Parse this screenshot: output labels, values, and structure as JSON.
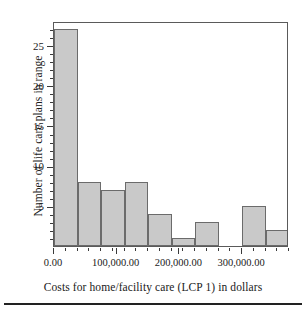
{
  "chart_data": {
    "type": "bar",
    "title": "",
    "xlabel": "Costs for home/facility care (LCP 1) in dollars",
    "ylabel": "Number of life care plans in range",
    "xlim": [
      0,
      375000
    ],
    "ylim": [
      0,
      28
    ],
    "grid": false,
    "legend": null,
    "bin_width": 37500,
    "bin_starts": [
      0,
      37500,
      75000,
      112500,
      150000,
      187500,
      225000,
      262500,
      300000,
      337500
    ],
    "categories": [
      "0–37,500",
      "37,500–75,000",
      "75,000–112,500",
      "112,500–150,000",
      "150,000–187,500",
      "187,500–225,000",
      "225,000–262,500",
      "262,500–300,000",
      "300,000–337,500",
      "337,500–375,000"
    ],
    "values": [
      27,
      8,
      7,
      8,
      4,
      1,
      3,
      0,
      5,
      2
    ],
    "xticks": [
      0,
      100000,
      200000,
      300000
    ],
    "xtick_labels": [
      "0.00",
      "100,000.00",
      "200,000.00",
      "300,000.00"
    ],
    "yticks": [
      5,
      10,
      15,
      20,
      25
    ],
    "ytick_labels": [
      "5",
      "10",
      "15",
      "20",
      "25"
    ],
    "y_minor_step": 1,
    "bar_fill": "#c9c9c9",
    "bar_edge": "#6b6b6b",
    "frame_color": "#5a5a5a",
    "text_color": "#1a1a1a"
  }
}
